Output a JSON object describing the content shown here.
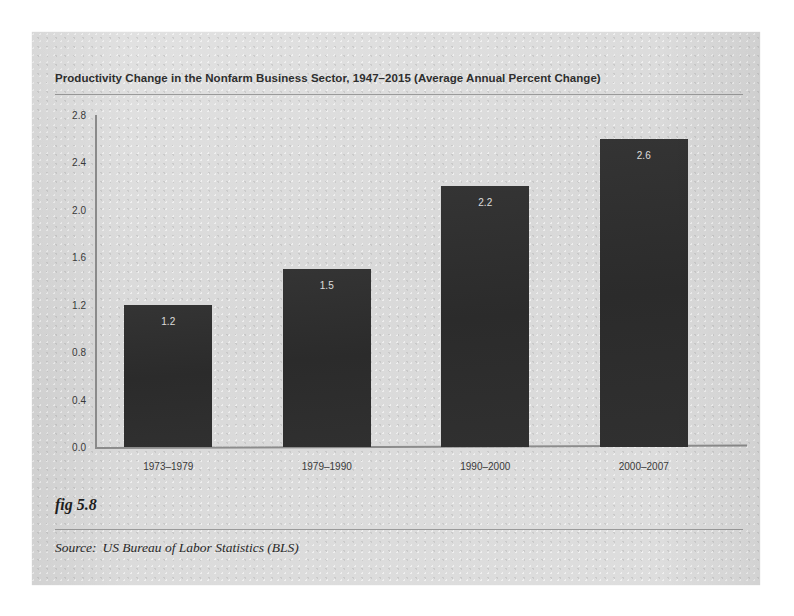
{
  "figure": {
    "title": "Productivity Change in the Nonfarm Business Sector, 1947–2015 (Average Annual Percent Change)",
    "fig_number": "fig 5.8",
    "source_label": "Source:",
    "source_text": "US Bureau of Labor Statistics (BLS)"
  },
  "colors": {
    "page_background": "#dcdcdc",
    "bar_fill": "#2d2d2d",
    "axis_line": "#8c8c8c",
    "rule_line": "#9a9a9a",
    "text": "#2e2e2e",
    "bar_value_text": "#f2f2f2"
  },
  "chart_data": {
    "type": "bar",
    "title": "Productivity Change in the Nonfarm Business Sector, 1947–2015 (Average Annual Percent Change)",
    "categories": [
      "1973–1979",
      "1979–1990",
      "1990–2000",
      "2000–2007"
    ],
    "values": [
      1.2,
      1.5,
      2.2,
      2.6
    ],
    "value_labels": [
      "1.2",
      "1.5",
      "2.2",
      "2.6"
    ],
    "xlabel": "",
    "ylabel": "",
    "ylim": [
      0.0,
      2.8
    ],
    "yticks": [
      0.0,
      0.4,
      0.8,
      1.2,
      1.6,
      2.0,
      2.4,
      2.8
    ],
    "ytick_labels": [
      "0.0",
      "0.4",
      "0.8",
      "1.2",
      "1.6",
      "2.0",
      "2.4",
      "2.8"
    ],
    "grid": false,
    "legend": null
  }
}
